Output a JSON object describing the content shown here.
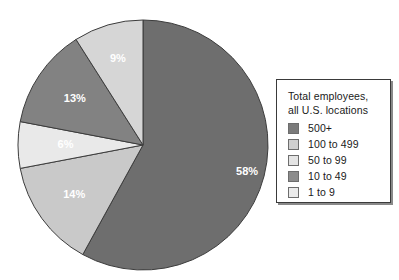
{
  "chart_data": {
    "type": "pie",
    "title": "",
    "legend_position": "right",
    "start_angle_deg": 0,
    "direction": "clockwise",
    "categories": [
      "500+",
      "100 to 499",
      "50 to 99",
      "10 to 49",
      "1 to 9"
    ],
    "values": [
      58,
      14,
      6,
      13,
      9
    ],
    "labels": [
      "58%",
      "14%",
      "6%",
      "13%",
      "9%"
    ],
    "colors": [
      "#6e6e6e",
      "#c9c9c9",
      "#e9e9e9",
      "#828282",
      "#d6d6d6"
    ],
    "label_color": "#ffffff",
    "slice_border_color": "#3c3c3c",
    "units": "percent",
    "slices": [
      {
        "category": "500+",
        "value": 58,
        "label": "58%",
        "color": "#6e6e6e"
      },
      {
        "category": "100 to 499",
        "value": 14,
        "label": "14%",
        "color": "#c9c9c9"
      },
      {
        "category": "50 to 99",
        "value": 6,
        "label": "6%",
        "color": "#e9e9e9"
      },
      {
        "category": "10 to 49",
        "value": 13,
        "label": "13%",
        "color": "#828282"
      },
      {
        "category": "1 to 9",
        "value": 9,
        "label": "9%",
        "color": "#d6d6d6"
      }
    ]
  },
  "legend": {
    "title_line1": "Total employees,",
    "title_line2": "all U.S. locations",
    "items": [
      {
        "label": "500+",
        "color": "#7b7b7b"
      },
      {
        "label": "100 to 499",
        "color": "#cfcfcf"
      },
      {
        "label": "50 to 99",
        "color": "#e4e4e4"
      },
      {
        "label": "10 to 49",
        "color": "#8c8c8c"
      },
      {
        "label": "1 to 9",
        "color": "#ebebeb"
      }
    ]
  }
}
